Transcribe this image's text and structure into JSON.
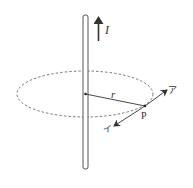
{
  "diagram": {
    "type": "physics-magnetic-field-around-straight-wire",
    "labels": {
      "current": "I",
      "radius": "r",
      "point": "P",
      "arrow_a": "ア",
      "arrow_b": "イ"
    },
    "colors": {
      "stroke": "#333333",
      "background": "#ffffff"
    }
  }
}
